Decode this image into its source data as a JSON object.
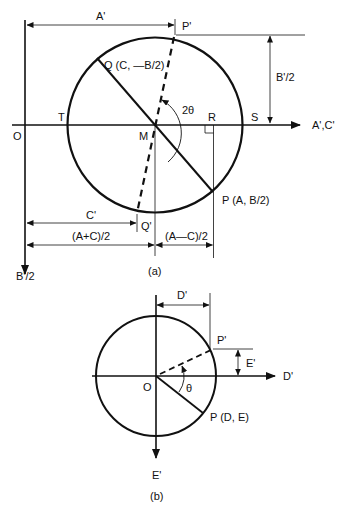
{
  "figure_a": {
    "caption": "(a)",
    "labels": {
      "A_prime": "A'",
      "P_prime": "P'",
      "Q": "Q (C, —B/2)",
      "B_prime_half_right": "B'/2",
      "two_theta": "2θ",
      "T": "T",
      "R": "R",
      "S": "S",
      "O": "O",
      "M": "M",
      "axis_x": "A',C'",
      "P": "P (A, B/2)",
      "C_prime": "C'",
      "Q_prime": "Q'",
      "A_plus_C_half": "(A+C)/2",
      "A_minus_C_half": "(A—C)/2",
      "axis_y": "B'/2"
    }
  },
  "figure_b": {
    "caption": "(b)",
    "labels": {
      "D_prime_dim": "D'",
      "P_prime": "P'",
      "E_prime_dim": "E'",
      "axis_x": "D'",
      "O": "O",
      "theta": "θ",
      "P": "P (D, E)",
      "axis_y": "E'"
    }
  }
}
